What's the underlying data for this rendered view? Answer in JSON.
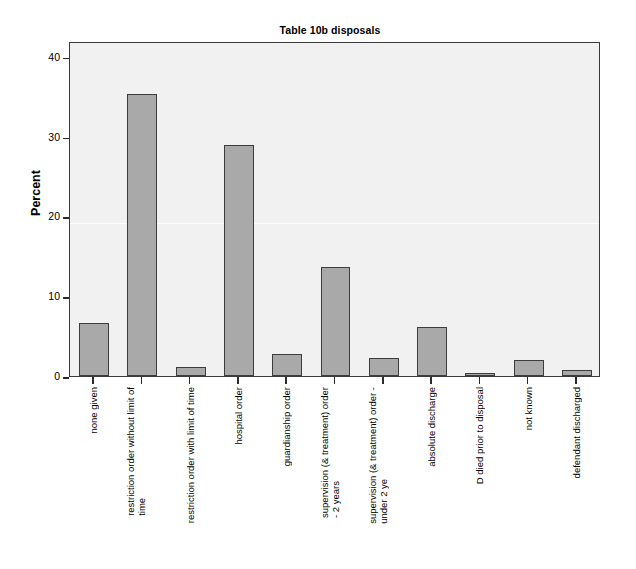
{
  "chart_data": {
    "type": "bar",
    "title": "Table 10b disposals",
    "xlabel": "",
    "ylabel": "Percent",
    "ylim": [
      0,
      42
    ],
    "yticks": [
      0,
      10,
      20,
      30,
      40
    ],
    "grid": false,
    "legend": "none",
    "bar_color": "#a9a9a9",
    "bar_edge_color": "#3c3c3c",
    "plot_background": "#f1f1f1",
    "categories": [
      "none given",
      "restriction order without limit of\ntime",
      "restriction order with limit of time",
      "hospital order",
      "guardianship order",
      "supervision (& treatment) order\n- 2 years",
      "supervision (& treatment) order -\nunder 2 ye",
      "absolute discharge",
      "D died prior to disposal",
      "not known",
      "defendant discharged"
    ],
    "values": [
      6.7,
      35.4,
      1.1,
      29.0,
      2.7,
      13.7,
      2.3,
      6.2,
      0.4,
      2.0,
      0.7
    ]
  },
  "axis": {
    "y_title": "Percent",
    "y_tick_labels": [
      "0",
      "10",
      "20",
      "30",
      "40"
    ]
  }
}
